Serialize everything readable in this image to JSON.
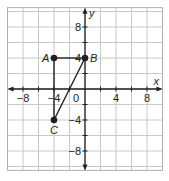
{
  "figure": {
    "type": "coordinate-plane",
    "grid_step": 2,
    "x_range": [
      -10,
      10
    ],
    "y_range": [
      -10.5,
      10.5
    ],
    "axis_labels": {
      "x": "x",
      "y": "y",
      "origin": "0"
    },
    "x_ticks": [
      {
        "value": -8,
        "label": "−8"
      },
      {
        "value": -4,
        "label": "−4"
      },
      {
        "value": 4,
        "label": "4"
      },
      {
        "value": 8,
        "label": "8"
      }
    ],
    "y_ticks": [
      {
        "value": 8,
        "label": "8"
      },
      {
        "value": 4,
        "label": "4"
      },
      {
        "value": -4,
        "label": "−4"
      },
      {
        "value": -8,
        "label": "−8"
      }
    ],
    "points": [
      {
        "name": "A",
        "x": -4,
        "y": 4
      },
      {
        "name": "B",
        "x": 0,
        "y": 4
      },
      {
        "name": "C",
        "x": -4,
        "y": -4
      }
    ],
    "segments": [
      [
        "A",
        "B"
      ],
      [
        "B",
        "C"
      ],
      [
        "A",
        "C"
      ]
    ],
    "colors": {
      "grid": "#c8c8c8",
      "axis": "#231f20",
      "point": "#231f20",
      "border": "#b0b0b0"
    }
  }
}
